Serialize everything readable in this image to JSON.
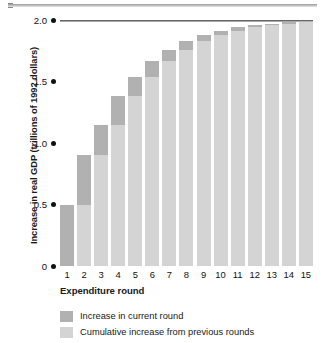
{
  "chart_data": {
    "type": "bar",
    "subtype": "stacked-bar",
    "title": "",
    "xlabel": "Expenditure round",
    "ylabel": "Increase in real GDP (trillions of 1992 dollars)",
    "categories": [
      "1",
      "2",
      "3",
      "4",
      "5",
      "6",
      "7",
      "8",
      "9",
      "10",
      "11",
      "12",
      "13",
      "14",
      "15"
    ],
    "ylim": [
      0,
      2.0
    ],
    "ytick_labels": [
      "2.0",
      "1.5",
      "1.0",
      "0.5",
      "0"
    ],
    "ytick_values": [
      2.0,
      1.5,
      1.0,
      0.5,
      0
    ],
    "grid": false,
    "gridline_at_top": 2.0,
    "legend_position": "below-plot",
    "series": [
      {
        "name": "Cumulative increase from previous rounds",
        "color": "#d4d4d4",
        "values": [
          0,
          0.5,
          0.9,
          1.15,
          1.38,
          1.54,
          1.67,
          1.76,
          1.83,
          1.88,
          1.91,
          1.94,
          1.96,
          1.97,
          1.98
        ]
      },
      {
        "name": "Increase in current round",
        "color": "#b1b1b1",
        "values": [
          0.5,
          0.4,
          0.25,
          0.23,
          0.16,
          0.13,
          0.09,
          0.07,
          0.05,
          0.03,
          0.03,
          0.02,
          0.01,
          0.01,
          0.01
        ]
      }
    ],
    "cumulative_totals": [
      0.5,
      0.9,
      1.15,
      1.38,
      1.54,
      1.67,
      1.76,
      1.83,
      1.88,
      1.91,
      1.94,
      1.96,
      1.97,
      1.98,
      1.99
    ]
  },
  "axes": {
    "y_title": "Increase in real GDP (trillions of 1992 dollars)",
    "x_title": "Expenditure round",
    "y_ticks": [
      {
        "label": "2.0",
        "value": 2.0
      },
      {
        "label": "1.5",
        "value": 1.5
      },
      {
        "label": "1.0",
        "value": 1.0
      },
      {
        "label": "0.5",
        "value": 0.5
      },
      {
        "label": "0",
        "value": 0
      }
    ],
    "x_ticks": [
      "1",
      "2",
      "3",
      "4",
      "5",
      "6",
      "7",
      "8",
      "9",
      "10",
      "11",
      "12",
      "13",
      "14",
      "15"
    ]
  },
  "legend": {
    "items": [
      {
        "label": "Increase in current round",
        "color": "#b1b1b1"
      },
      {
        "label": "Cumulative increase from previous rounds",
        "color": "#d4d4d4"
      }
    ]
  },
  "colors": {
    "current_round": "#b1b1b1",
    "cumulative": "#d4d4d4",
    "axis_text": "#111111",
    "gridline": "#4a4a4a",
    "background": "#ffffff"
  }
}
